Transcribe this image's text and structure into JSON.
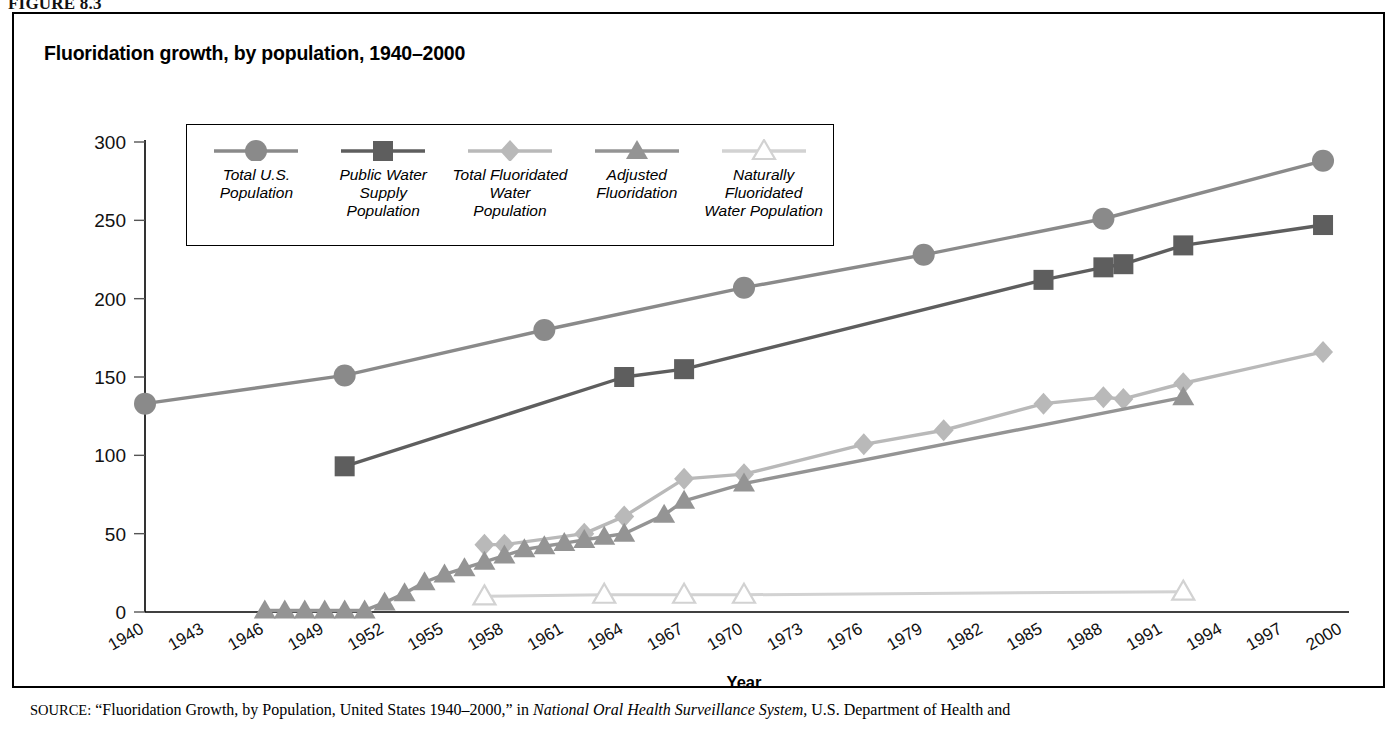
{
  "figure": {
    "label": "FIGURE 8.3",
    "title": "Fluoridation growth, by population, 1940–2000"
  },
  "axes": {
    "y_ticks": [
      "0",
      "50",
      "100",
      "150",
      "200",
      "250",
      "300"
    ],
    "x_ticks": [
      "1940",
      "1943",
      "1946",
      "1949",
      "1952",
      "1955",
      "1958",
      "1961",
      "1964",
      "1967",
      "1970",
      "1973",
      "1976",
      "1979",
      "1982",
      "1985",
      "1988",
      "1991",
      "1994",
      "1997",
      "2000"
    ],
    "x_title": "Year",
    "y_title": ""
  },
  "legend": {
    "items": [
      {
        "label": "Total U.S.\nPopulation",
        "marker": "circle-icon",
        "color": "#8a8a8a"
      },
      {
        "label": "Public Water\nSupply\nPopulation",
        "marker": "square-icon",
        "color": "#5e5e5e"
      },
      {
        "label": "Total Fluoridated\nWater\nPopulation",
        "marker": "diamond-icon",
        "color": "#b9b9b9"
      },
      {
        "label": "Adjusted\nFluoridation",
        "marker": "triangle-filled-icon",
        "color": "#949494"
      },
      {
        "label": "Naturally\nFluoridated\nWater Population",
        "marker": "triangle-open-icon",
        "color": "#d2d2d2"
      }
    ]
  },
  "source": {
    "prefix": "SOURCE:",
    "quote": "“Fluoridation Growth, by Population, United States 1940–2000,”",
    "in_word": "in",
    "italic_title": "National Oral Health Surveillance System,",
    "tail": "U.S. Department of Health and"
  },
  "chart_data": {
    "type": "line",
    "title": "Fluoridation growth, by population, 1940–2000",
    "xlabel": "Year",
    "ylabel": "",
    "xlim": [
      1940,
      2000
    ],
    "ylim": [
      0,
      300
    ],
    "grid": false,
    "legend_position": "top-left-inside",
    "series": [
      {
        "name": "Total U.S. Population",
        "marker": "circle",
        "color": "#8a8a8a",
        "points": [
          {
            "x": 1940,
            "y": 133
          },
          {
            "x": 1950,
            "y": 151
          },
          {
            "x": 1960,
            "y": 180
          },
          {
            "x": 1970,
            "y": 207
          },
          {
            "x": 1979,
            "y": 228
          },
          {
            "x": 1988,
            "y": 251
          },
          {
            "x": 1999,
            "y": 288
          }
        ]
      },
      {
        "name": "Public Water Supply Population",
        "marker": "square",
        "color": "#5e5e5e",
        "points": [
          {
            "x": 1950,
            "y": 93
          },
          {
            "x": 1964,
            "y": 150
          },
          {
            "x": 1967,
            "y": 155
          },
          {
            "x": 1985,
            "y": 212
          },
          {
            "x": 1988,
            "y": 220
          },
          {
            "x": 1989,
            "y": 222
          },
          {
            "x": 1992,
            "y": 234
          },
          {
            "x": 1999,
            "y": 247
          }
        ]
      },
      {
        "name": "Total Fluoridated Water Population",
        "marker": "diamond",
        "color": "#b9b9b9",
        "points": [
          {
            "x": 1957,
            "y": 43
          },
          {
            "x": 1958,
            "y": 43
          },
          {
            "x": 1962,
            "y": 50
          },
          {
            "x": 1964,
            "y": 61
          },
          {
            "x": 1967,
            "y": 85
          },
          {
            "x": 1970,
            "y": 88
          },
          {
            "x": 1976,
            "y": 107
          },
          {
            "x": 1980,
            "y": 116
          },
          {
            "x": 1985,
            "y": 133
          },
          {
            "x": 1988,
            "y": 137
          },
          {
            "x": 1989,
            "y": 136
          },
          {
            "x": 1992,
            "y": 146
          },
          {
            "x": 1999,
            "y": 166
          }
        ]
      },
      {
        "name": "Adjusted Fluoridation",
        "marker": "triangle-filled",
        "color": "#949494",
        "points": [
          {
            "x": 1946,
            "y": 1
          },
          {
            "x": 1947,
            "y": 1
          },
          {
            "x": 1948,
            "y": 1
          },
          {
            "x": 1949,
            "y": 1
          },
          {
            "x": 1950,
            "y": 1
          },
          {
            "x": 1951,
            "y": 1
          },
          {
            "x": 1952,
            "y": 6
          },
          {
            "x": 1953,
            "y": 12
          },
          {
            "x": 1954,
            "y": 19
          },
          {
            "x": 1955,
            "y": 24
          },
          {
            "x": 1956,
            "y": 28
          },
          {
            "x": 1957,
            "y": 32
          },
          {
            "x": 1958,
            "y": 36
          },
          {
            "x": 1959,
            "y": 40
          },
          {
            "x": 1960,
            "y": 42
          },
          {
            "x": 1961,
            "y": 44
          },
          {
            "x": 1962,
            "y": 46
          },
          {
            "x": 1963,
            "y": 48
          },
          {
            "x": 1964,
            "y": 50
          },
          {
            "x": 1966,
            "y": 62
          },
          {
            "x": 1967,
            "y": 71
          },
          {
            "x": 1970,
            "y": 82
          },
          {
            "x": 1992,
            "y": 137
          }
        ]
      },
      {
        "name": "Naturally Fluoridated Water Population",
        "marker": "triangle-open",
        "color": "#d2d2d2",
        "points": [
          {
            "x": 1957,
            "y": 10
          },
          {
            "x": 1963,
            "y": 11
          },
          {
            "x": 1967,
            "y": 11
          },
          {
            "x": 1970,
            "y": 11
          },
          {
            "x": 1992,
            "y": 13
          }
        ]
      }
    ]
  }
}
